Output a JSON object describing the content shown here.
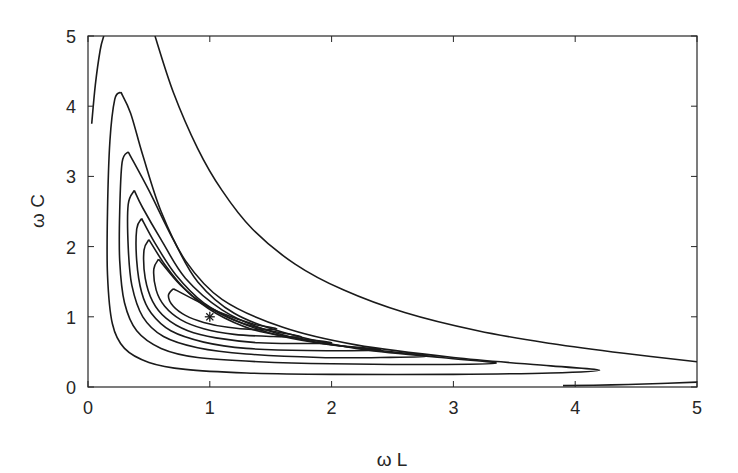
{
  "chart_data": {
    "type": "contour",
    "title": "",
    "xlabel": "ω L",
    "ylabel": "ω C",
    "xlim": [
      0,
      5
    ],
    "ylim": [
      0,
      5
    ],
    "xticks": [
      0,
      1,
      2,
      3,
      4,
      5
    ],
    "yticks": [
      0,
      1,
      2,
      3,
      4,
      5
    ],
    "grid": false,
    "legend": null,
    "line_color": "#1a1a1a",
    "marker": {
      "symbol": "*",
      "x": 1,
      "y": 1
    },
    "contours": [
      {
        "name": "outer-left",
        "points": [
          [
            0.03,
            3.75
          ],
          [
            0.06,
            4.3
          ],
          [
            0.1,
            4.8
          ],
          [
            0.13,
            5.0
          ]
        ]
      },
      {
        "name": "outer-bottom",
        "points": [
          [
            3.9,
            0.02
          ],
          [
            4.3,
            0.03
          ],
          [
            4.7,
            0.05
          ],
          [
            5.0,
            0.07
          ]
        ]
      },
      {
        "name": "open-1",
        "points": [
          [
            0.55,
            5.0
          ],
          [
            0.7,
            4.2
          ],
          [
            0.9,
            3.4
          ],
          [
            1.1,
            2.8
          ],
          [
            1.35,
            2.25
          ],
          [
            1.7,
            1.75
          ],
          [
            2.1,
            1.38
          ],
          [
            2.6,
            1.06
          ],
          [
            3.2,
            0.8
          ],
          [
            3.8,
            0.62
          ],
          [
            4.4,
            0.48
          ],
          [
            5.0,
            0.36
          ]
        ]
      },
      {
        "name": "loop-1",
        "points": [
          [
            0.27,
            4.2
          ],
          [
            0.22,
            4.1
          ],
          [
            0.18,
            3.5
          ],
          [
            0.16,
            2.5
          ],
          [
            0.16,
            1.6
          ],
          [
            0.2,
            0.9
          ],
          [
            0.3,
            0.55
          ],
          [
            0.5,
            0.35
          ],
          [
            0.8,
            0.25
          ],
          [
            1.3,
            0.2
          ],
          [
            2.0,
            0.18
          ],
          [
            3.0,
            0.18
          ],
          [
            3.8,
            0.2
          ],
          [
            4.2,
            0.24
          ],
          [
            3.8,
            0.3
          ],
          [
            3.0,
            0.42
          ],
          [
            2.2,
            0.6
          ],
          [
            1.6,
            0.85
          ],
          [
            1.1,
            1.25
          ],
          [
            0.8,
            1.8
          ],
          [
            0.6,
            2.5
          ],
          [
            0.45,
            3.3
          ],
          [
            0.35,
            3.9
          ],
          [
            0.27,
            4.2
          ]
        ]
      },
      {
        "name": "loop-2",
        "points": [
          [
            0.33,
            3.35
          ],
          [
            0.28,
            3.2
          ],
          [
            0.26,
            2.5
          ],
          [
            0.26,
            1.8
          ],
          [
            0.3,
            1.2
          ],
          [
            0.4,
            0.8
          ],
          [
            0.6,
            0.55
          ],
          [
            0.9,
            0.42
          ],
          [
            1.4,
            0.36
          ],
          [
            2.0,
            0.33
          ],
          [
            2.8,
            0.32
          ],
          [
            3.35,
            0.34
          ],
          [
            2.9,
            0.42
          ],
          [
            2.2,
            0.55
          ],
          [
            1.6,
            0.78
          ],
          [
            1.2,
            1.05
          ],
          [
            0.9,
            1.5
          ],
          [
            0.7,
            2.1
          ],
          [
            0.5,
            2.8
          ],
          [
            0.33,
            3.35
          ]
        ]
      },
      {
        "name": "loop-3",
        "points": [
          [
            0.38,
            2.8
          ],
          [
            0.33,
            2.6
          ],
          [
            0.33,
            2.0
          ],
          [
            0.36,
            1.45
          ],
          [
            0.45,
            1.0
          ],
          [
            0.62,
            0.72
          ],
          [
            0.9,
            0.56
          ],
          [
            1.3,
            0.47
          ],
          [
            1.9,
            0.42
          ],
          [
            2.4,
            0.42
          ],
          [
            2.8,
            0.44
          ],
          [
            2.4,
            0.52
          ],
          [
            1.9,
            0.63
          ],
          [
            1.45,
            0.82
          ],
          [
            1.1,
            1.1
          ],
          [
            0.8,
            1.55
          ],
          [
            0.6,
            2.1
          ],
          [
            0.45,
            2.55
          ],
          [
            0.38,
            2.8
          ]
        ]
      },
      {
        "name": "loop-4",
        "points": [
          [
            0.44,
            2.4
          ],
          [
            0.4,
            2.25
          ],
          [
            0.4,
            1.8
          ],
          [
            0.44,
            1.35
          ],
          [
            0.52,
            1.05
          ],
          [
            0.68,
            0.8
          ],
          [
            0.95,
            0.64
          ],
          [
            1.3,
            0.55
          ],
          [
            1.8,
            0.52
          ],
          [
            2.4,
            0.53
          ],
          [
            2.0,
            0.6
          ],
          [
            1.6,
            0.72
          ],
          [
            1.25,
            0.92
          ],
          [
            0.95,
            1.2
          ],
          [
            0.72,
            1.6
          ],
          [
            0.55,
            2.05
          ],
          [
            0.44,
            2.4
          ]
        ]
      },
      {
        "name": "loop-5",
        "points": [
          [
            0.5,
            2.1
          ],
          [
            0.46,
            1.95
          ],
          [
            0.47,
            1.55
          ],
          [
            0.53,
            1.22
          ],
          [
            0.64,
            0.98
          ],
          [
            0.82,
            0.8
          ],
          [
            1.05,
            0.7
          ],
          [
            1.4,
            0.63
          ],
          [
            1.75,
            0.62
          ],
          [
            2.0,
            0.63
          ],
          [
            1.7,
            0.7
          ],
          [
            1.35,
            0.82
          ],
          [
            1.05,
            1.05
          ],
          [
            0.82,
            1.35
          ],
          [
            0.64,
            1.72
          ],
          [
            0.5,
            2.1
          ]
        ]
      },
      {
        "name": "loop-6",
        "points": [
          [
            0.58,
            1.82
          ],
          [
            0.54,
            1.68
          ],
          [
            0.56,
            1.38
          ],
          [
            0.63,
            1.15
          ],
          [
            0.76,
            0.96
          ],
          [
            0.95,
            0.83
          ],
          [
            1.2,
            0.75
          ],
          [
            1.5,
            0.72
          ],
          [
            1.75,
            0.72
          ],
          [
            1.5,
            0.8
          ],
          [
            1.2,
            0.95
          ],
          [
            0.95,
            1.18
          ],
          [
            0.76,
            1.45
          ],
          [
            0.58,
            1.82
          ]
        ]
      },
      {
        "name": "loop-7",
        "points": [
          [
            0.7,
            1.4
          ],
          [
            0.66,
            1.3
          ],
          [
            0.7,
            1.15
          ],
          [
            0.8,
            1.02
          ],
          [
            0.95,
            0.92
          ],
          [
            1.15,
            0.85
          ],
          [
            1.35,
            0.82
          ],
          [
            1.55,
            0.83
          ],
          [
            1.35,
            0.9
          ],
          [
            1.1,
            1.05
          ],
          [
            0.9,
            1.22
          ],
          [
            0.7,
            1.4
          ]
        ]
      }
    ]
  }
}
